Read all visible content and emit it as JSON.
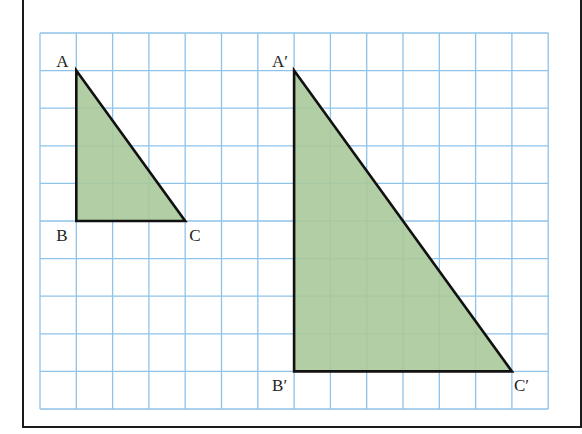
{
  "grid": {
    "origin_x": 40,
    "origin_y": 33,
    "cell_w": 36.3,
    "cell_h": 37.6,
    "cols": 14,
    "rows": 10,
    "line_color": "#8ec3ea"
  },
  "colors": {
    "fill": "#a9c99a",
    "stroke": "#111111",
    "frame": "#1a1a1a"
  },
  "triangles": [
    {
      "name": "original",
      "points": [
        [
          1,
          1
        ],
        [
          1,
          5
        ],
        [
          4,
          5
        ]
      ],
      "labels": [
        {
          "text": "A",
          "dx": -20,
          "dy": -4
        },
        {
          "text": "B",
          "dx": -20,
          "dy": 20
        },
        {
          "text": "C",
          "dx": 4,
          "dy": 20
        }
      ]
    },
    {
      "name": "image",
      "points": [
        [
          7,
          1
        ],
        [
          7,
          9
        ],
        [
          13,
          9
        ]
      ],
      "labels": [
        {
          "text": "A′",
          "dx": -22,
          "dy": -4
        },
        {
          "text": "B′",
          "dx": -22,
          "dy": 20
        },
        {
          "text": "C′",
          "dx": 2,
          "dy": 20
        }
      ]
    }
  ]
}
